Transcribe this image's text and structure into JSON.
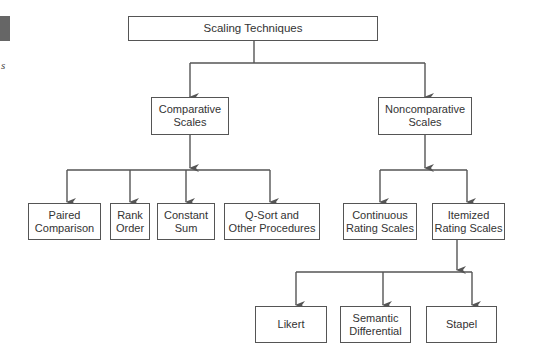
{
  "diagram": {
    "root": {
      "label": "Scaling Techniques"
    },
    "level1": [
      {
        "id": "comparative",
        "label": "Comparative\nScales"
      },
      {
        "id": "noncomparative",
        "label": "Noncomparative\nScales"
      }
    ],
    "comparative_children": [
      {
        "label": "Paired\nComparison"
      },
      {
        "label": "Rank\nOrder"
      },
      {
        "label": "Constant\nSum"
      },
      {
        "label": "Q-Sort and\nOther Procedures"
      }
    ],
    "noncomparative_children": [
      {
        "label": "Continuous\nRating Scales"
      },
      {
        "label": "Itemized\nRating Scales"
      }
    ],
    "itemized_children": [
      {
        "label": "Likert"
      },
      {
        "label": "Semantic\nDifferential"
      },
      {
        "label": "Stapel"
      }
    ]
  },
  "margin": {
    "partial_text": "s"
  },
  "colors": {
    "line": "#555555",
    "box_border": "#555555",
    "text": "#333333"
  }
}
